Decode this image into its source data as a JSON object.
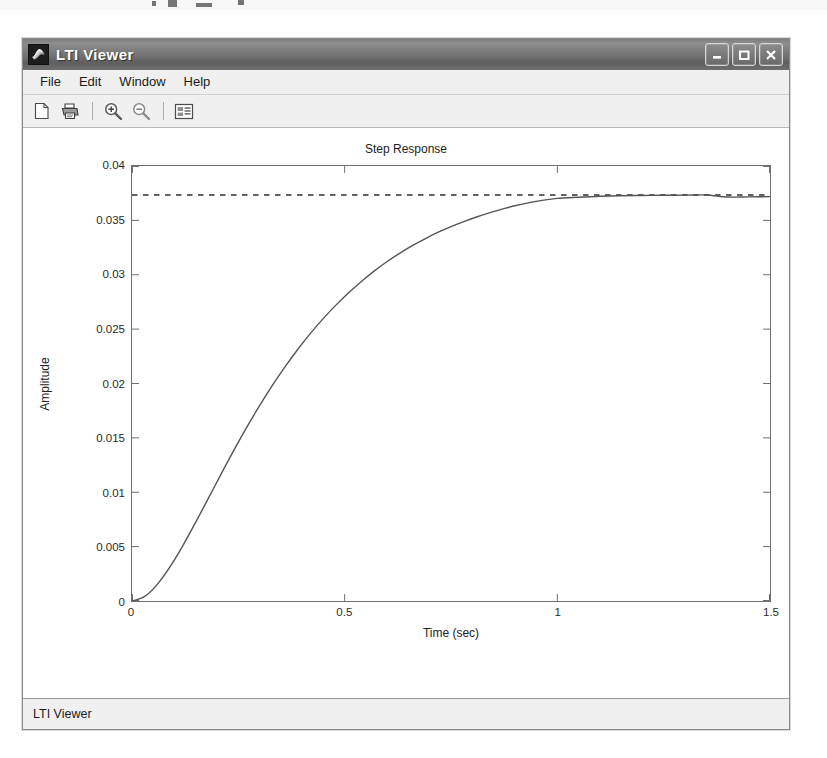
{
  "window": {
    "title": "LTI Viewer",
    "app_icon": "matlab-membrane-icon",
    "caption_buttons": [
      {
        "name": "minimize-button",
        "glyph": "minimize"
      },
      {
        "name": "maximize-button",
        "glyph": "maximize"
      },
      {
        "name": "close-button",
        "glyph": "close"
      }
    ]
  },
  "menubar": {
    "items": [
      {
        "label": "File"
      },
      {
        "label": "Edit"
      },
      {
        "label": "Window"
      },
      {
        "label": "Help"
      }
    ]
  },
  "toolbar": {
    "buttons": [
      {
        "name": "new-document-button",
        "icon": "new-document-icon"
      },
      {
        "name": "print-button",
        "icon": "printer-icon"
      },
      {
        "name": "zoom-in-button",
        "icon": "zoom-in-icon"
      },
      {
        "name": "zoom-out-button",
        "icon": "zoom-out-icon"
      },
      {
        "name": "properties-button",
        "icon": "properties-list-icon"
      }
    ]
  },
  "statusbar": {
    "text": "LTI Viewer"
  },
  "colors": {
    "titlebar_dark": "#5f5f5f",
    "titlebar_light": "#8d8d8d",
    "plot_line": "#555555",
    "axis": "#6f6f6f",
    "panel": "#f0f0f0",
    "plot_background": "#ffffff"
  },
  "chart_data": {
    "type": "line",
    "title": "Step Response",
    "xlabel": "Time (sec)",
    "ylabel": "Amplitude",
    "xlim": [
      0,
      1.5
    ],
    "ylim": [
      0,
      0.04
    ],
    "xticks": [
      0,
      0.5,
      1,
      1.5
    ],
    "xtick_labels": [
      "0",
      "0.5",
      "1",
      "1.5"
    ],
    "yticks": [
      0,
      0.005,
      0.01,
      0.015,
      0.02,
      0.025,
      0.03,
      0.035,
      0.04
    ],
    "ytick_labels": [
      "0",
      "0.005",
      "0.01",
      "0.015",
      "0.02",
      "0.025",
      "0.03",
      "0.035",
      "0.04"
    ],
    "grid": false,
    "legend": null,
    "series": [
      {
        "name": "Step response",
        "style": "solid",
        "x": [
          0,
          0.03,
          0.06,
          0.09,
          0.12,
          0.15,
          0.18,
          0.21,
          0.24,
          0.27,
          0.3,
          0.33,
          0.36,
          0.39,
          0.42,
          0.45,
          0.48,
          0.51,
          0.54,
          0.57,
          0.6,
          0.63,
          0.66,
          0.69,
          0.72,
          0.75,
          0.78,
          0.81,
          0.84,
          0.87,
          0.9,
          0.95,
          1.0,
          1.05,
          1.1,
          1.15,
          1.2,
          1.25,
          1.3,
          1.35,
          1.4,
          1.45,
          1.5
        ],
        "y": [
          0.0,
          0.00042,
          0.00155,
          0.00318,
          0.00512,
          0.00726,
          0.00948,
          0.01171,
          0.01389,
          0.01598,
          0.01796,
          0.01982,
          0.02155,
          0.02315,
          0.02463,
          0.02599,
          0.02723,
          0.02837,
          0.02941,
          0.03036,
          0.03122,
          0.03199,
          0.0327,
          0.03333,
          0.03391,
          0.03443,
          0.03489,
          0.03531,
          0.03569,
          0.03603,
          0.03634,
          0.03675,
          0.03702,
          0.03713,
          0.03722,
          0.03727,
          0.03729,
          0.03731,
          0.03732,
          0.03734,
          0.03715,
          0.03716,
          0.03718
        ]
      },
      {
        "name": "Steady-state asymptote",
        "style": "dashed",
        "x": [
          0,
          1.5
        ],
        "y": [
          0.03733,
          0.03733
        ]
      }
    ]
  }
}
